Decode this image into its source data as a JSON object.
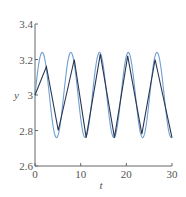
{
  "chart_data": {
    "type": "line",
    "title": "",
    "xlabel": "t",
    "ylabel": "y",
    "xlim": [
      0,
      30
    ],
    "ylim": [
      2.6,
      3.4
    ],
    "xticks": [
      "0",
      "10",
      "20",
      "30"
    ],
    "yticks": [
      "2.6",
      "2.8",
      "3",
      "3.2",
      "3.4"
    ],
    "grid": false,
    "legend": null,
    "series": [
      {
        "name": "sinusoid",
        "color": "#6f9fd0",
        "function": "3 + 0.24*sin(t)",
        "x": [
          0,
          1.57,
          4.71,
          7.85,
          10.99,
          14.14,
          17.28,
          20.42,
          23.56,
          26.7,
          29.85,
          30
        ],
        "y": [
          3.0,
          3.24,
          2.76,
          3.24,
          2.76,
          3.24,
          2.76,
          3.24,
          2.76,
          3.24,
          2.76,
          2.77
        ]
      },
      {
        "name": "approximation",
        "color": "#2a3550",
        "x": [
          0,
          2.5,
          5.1,
          8.6,
          11.2,
          14.3,
          17.4,
          20.3,
          23.4,
          26.3,
          30
        ],
        "y": [
          3.0,
          3.16,
          2.8,
          3.2,
          2.76,
          3.23,
          2.76,
          3.22,
          2.78,
          3.2,
          2.76
        ]
      }
    ]
  }
}
